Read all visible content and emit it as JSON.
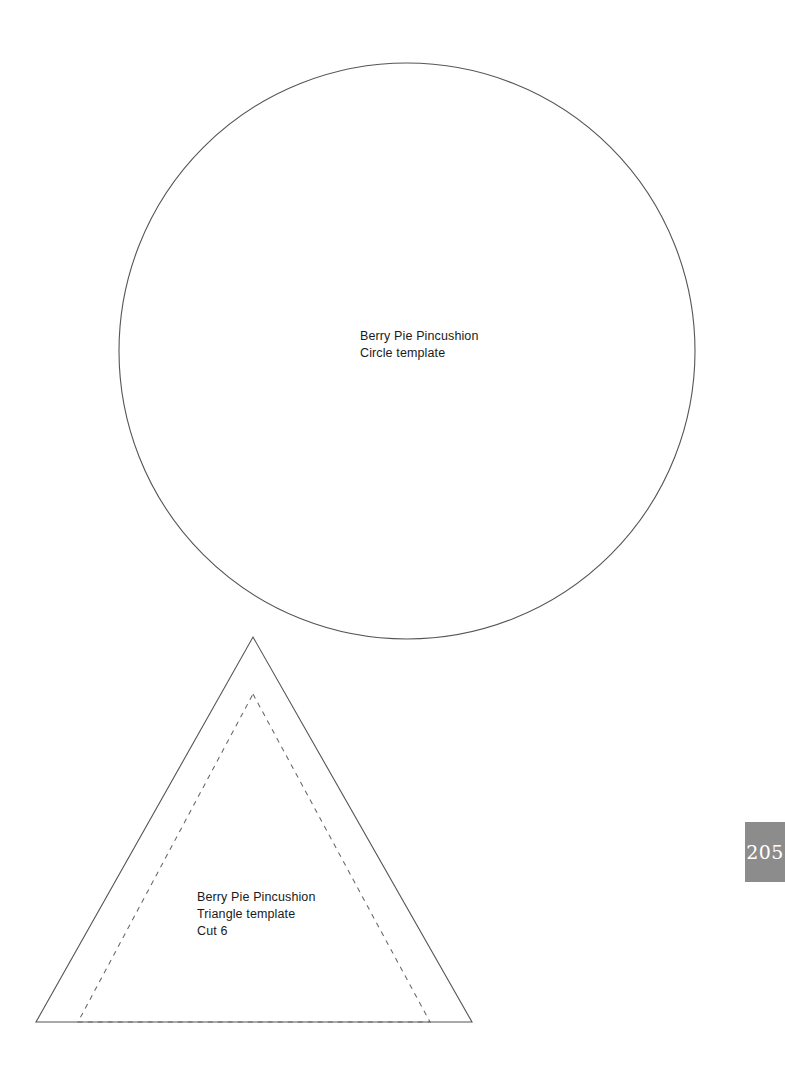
{
  "page": {
    "background_color": "#ffffff",
    "stroke_color": "#555555",
    "page_number": "205",
    "page_number_badge_color": "#8c8c8c",
    "page_number_text_color": "#ffffff"
  },
  "circle_template": {
    "label_lines": [
      "Berry Pie Pincushion",
      "Circle template"
    ],
    "shape": "circle",
    "center_x": 407,
    "center_y": 351,
    "radius": 288
  },
  "triangle_template": {
    "label_lines": [
      "Berry Pie Pincushion",
      "Triangle template",
      "Cut 6"
    ],
    "shape": "triangle",
    "outline_points": "253,637 472,1022 36,1022",
    "seam_line_points": "253,694 430,1022 78,1022",
    "seam_line_style": "dashed"
  }
}
